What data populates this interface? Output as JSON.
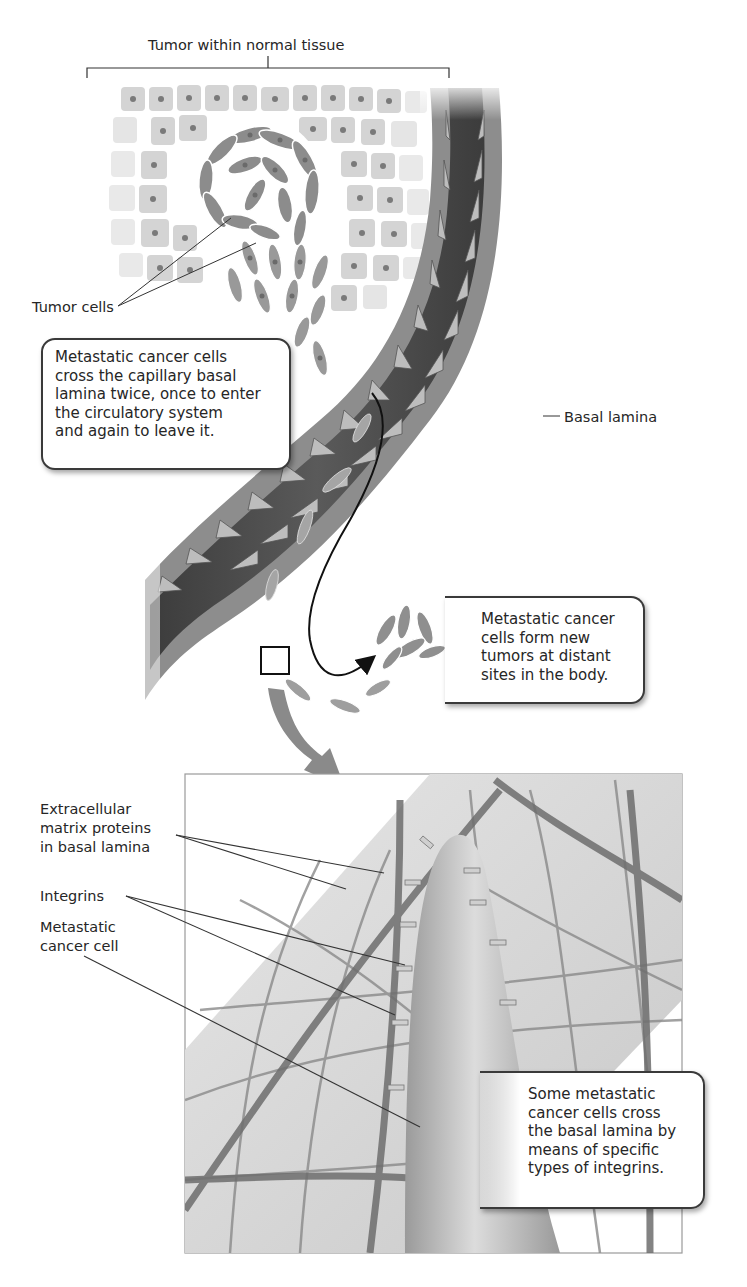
{
  "figure": {
    "header_fragment": "…g… …y",
    "colors": {
      "vessel_lumen": "#4a4a4a",
      "vessel_wall": "#8f8f8f",
      "endothelial_cell": "#bdbdbd",
      "tumor_cell": "#8a8a8a",
      "normal_cell": "#d6d6d6",
      "inset_background": "#d9d9d9",
      "arrow": "#888888",
      "line": "#2b2b2b"
    }
  },
  "labels": {
    "tumor_region": "Tumor within normal tissue",
    "tumor_cells": "Tumor cells",
    "basal_lamina": "Basal lamina",
    "ecm_proteins": [
      "Extracellular",
      "matrix proteins",
      "in basal lamina"
    ],
    "integrins": "Integrins",
    "metastatic_cell": [
      "Metastatic",
      "cancer cell"
    ]
  },
  "callouts": {
    "cross_twice": [
      "Metastatic cancer cells",
      "cross the capillary basal",
      "lamina twice, once to enter",
      "the circulatory system",
      "and again to leave it."
    ],
    "new_tumors": [
      "Metastatic cancer",
      "cells form new",
      "tumors at distant",
      "sites in the body."
    ],
    "integrins_cross": [
      "Some metastatic",
      "cancer cells cross",
      "the basal lamina by",
      "means of specific",
      "types of integrins."
    ]
  }
}
